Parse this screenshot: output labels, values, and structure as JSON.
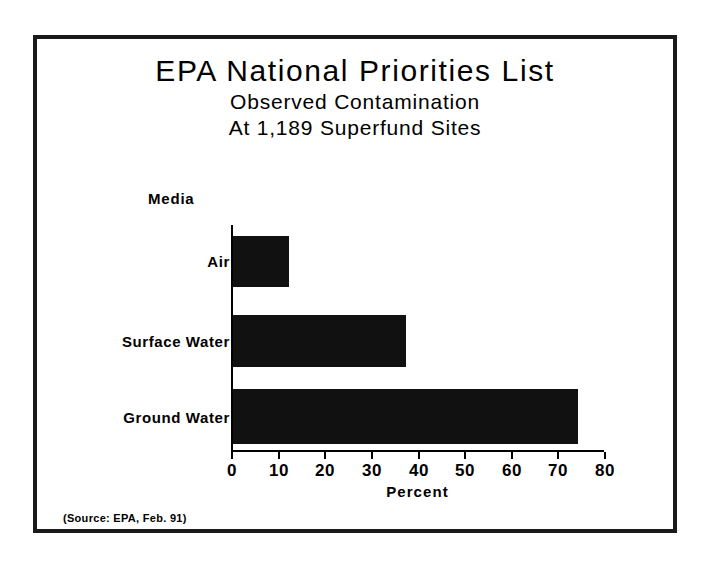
{
  "figure": {
    "title_lines": [
      "EPA National Priorities List",
      "Observed Contamination",
      "At 1,189 Superfund Sites"
    ],
    "source_note": "(Source: EPA, Feb. 91)",
    "group_axis_label": "Media",
    "frame_color": "#1a1a1a",
    "bar_color": "#111111",
    "background_color": "#ffffff"
  },
  "chart_data": {
    "type": "bar",
    "orientation": "horizontal",
    "title": "EPA National Priorities List",
    "subtitle": "Observed Contamination At 1,189 Superfund Sites",
    "categories": [
      "Air",
      "Surface Water",
      "Ground Water"
    ],
    "values": [
      12,
      37,
      74
    ],
    "xlabel": "Percent",
    "ylabel": "Media",
    "xlim": [
      0,
      80
    ],
    "xticks": [
      0,
      10,
      20,
      30,
      40,
      50,
      60,
      70,
      80
    ],
    "xtick_labels": [
      "0",
      "10",
      "20",
      "30",
      "40",
      "50",
      "60",
      "70",
      "80"
    ],
    "grid": false,
    "legend": false,
    "series_color": "#111111"
  }
}
